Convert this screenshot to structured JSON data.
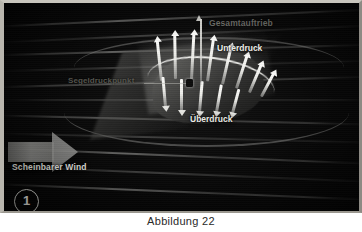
{
  "figure": {
    "badge_number": "1",
    "caption": "Abbildung 22",
    "labels": {
      "total_lift": "Gesamtauftrieb",
      "low_pressure": "Unterdruck",
      "high_pressure": "Überdruck",
      "sail_center_of_effort": "Segeldruckpunkt",
      "apparent_wind": "Scheinbarer Wind"
    },
    "colors": {
      "plate_background": "#050505",
      "label_bright": "#efefe9",
      "label_dim": "#6e6e69",
      "arrow_white": "#fcfcfa",
      "streamline": "#a8a8a5",
      "frame": "#c8c5bd"
    },
    "icons": {
      "badge": "circled-number-icon",
      "wind": "block-arrow-right-icon",
      "lift": "arrow-up-icon"
    }
  }
}
